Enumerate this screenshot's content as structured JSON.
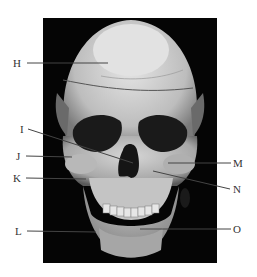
{
  "figure": {
    "background_color": "#050505",
    "bone_color": "#c9c9c9",
    "line_color": "#444444",
    "labels": [
      {
        "id": "H",
        "text": "H",
        "side": "left",
        "x": 13,
        "y": 58,
        "line": [
          27,
          63,
          108,
          63
        ]
      },
      {
        "id": "I",
        "text": "I",
        "side": "left",
        "x": 20,
        "y": 124,
        "line": [
          28,
          129,
          133,
          163
        ]
      },
      {
        "id": "J",
        "text": "J",
        "side": "left",
        "x": 16,
        "y": 151,
        "line": [
          26,
          156,
          72,
          157
        ]
      },
      {
        "id": "K",
        "text": "K",
        "side": "left",
        "x": 13,
        "y": 173,
        "line": [
          26,
          178,
          86,
          179
        ]
      },
      {
        "id": "L",
        "text": "L",
        "side": "left",
        "x": 15,
        "y": 226,
        "line": [
          27,
          231,
          96,
          232
        ]
      },
      {
        "id": "M",
        "text": "M",
        "side": "right",
        "x": 233,
        "y": 158,
        "line": [
          168,
          163,
          231,
          163
        ]
      },
      {
        "id": "N",
        "text": "N",
        "side": "right",
        "x": 233,
        "y": 184,
        "line": [
          153,
          171,
          230,
          189
        ]
      },
      {
        "id": "O",
        "text": "O",
        "side": "right",
        "x": 233,
        "y": 224,
        "line": [
          140,
          229,
          231,
          229
        ]
      }
    ]
  }
}
